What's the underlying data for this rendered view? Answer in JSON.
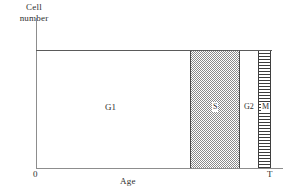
{
  "chart_data": {
    "type": "bar",
    "title": "",
    "subtitle": "",
    "ylabel_line1": "Cell",
    "ylabel_line2": "number",
    "xlabel": "Age",
    "x_ticks": [
      "0",
      "T"
    ],
    "xlim": [
      "0",
      "T"
    ],
    "ylim": [
      "0",
      "Cell number"
    ],
    "grid": false,
    "legend": "none",
    "categories": [
      "G1",
      "S",
      "G2",
      "M"
    ],
    "phases": [
      {
        "label": "G1",
        "start_fraction": 0.0,
        "end_fraction": 0.653,
        "fill": "white",
        "fill_color": "#ffffff"
      },
      {
        "label": "S",
        "start_fraction": 0.653,
        "end_fraction": 0.866,
        "fill": "cross-hatch",
        "fill_color": "#8a8a8a"
      },
      {
        "label": "G2",
        "start_fraction": 0.866,
        "end_fraction": 0.943,
        "fill": "white",
        "fill_color": "#ffffff"
      },
      {
        "label": "M",
        "start_fraction": 0.943,
        "end_fraction": 1.0,
        "fill": "horizontal-stripes",
        "fill_color": "#3c3c3c"
      }
    ],
    "values": [
      0.653,
      0.213,
      0.077,
      0.057
    ],
    "axis_color": "#8d8d8d",
    "plateau_line_color": "#5a5a5a"
  },
  "axes": {
    "y_label_line1": "Cell",
    "y_label_line2": "number",
    "x_label": "Age",
    "x_tick_origin": "0",
    "x_tick_end": "T"
  },
  "labels": {
    "g1": "G1",
    "s": "S",
    "g2": "G2",
    "m": "M"
  }
}
